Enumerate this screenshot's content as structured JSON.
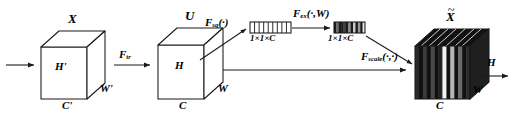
{
  "diagram": {
    "background": "#ffffff",
    "stroke": "#1a1a1a"
  },
  "blocks": {
    "input_cube": {
      "name": "X",
      "top_label": "X",
      "front_label": "H'",
      "right_label": "W'",
      "bottom_label": "C'"
    },
    "feature_cube": {
      "name": "U",
      "top_label": "U",
      "front_label": "H",
      "right_label": "W",
      "bottom_label": "C"
    },
    "output_cube": {
      "name": "X tilde",
      "top_label": "X",
      "top_label_accent": "~",
      "right_label": "H",
      "bottom_right_label": "W",
      "bottom_label": "C"
    }
  },
  "vectors": {
    "squeeze": {
      "label": "1×1×C",
      "segments": 9,
      "fill": "#ffffff"
    },
    "excite": {
      "label": "1×1×C",
      "segments": 13,
      "pattern": [
        "#1a1a1a",
        "#6e6e6e",
        "#1a1a1a",
        "#1a1a1a",
        "#404040",
        "#1a1a1a",
        "#8c8c8c",
        "#1a1a1a",
        "#c9c9c9",
        "#1a1a1a",
        "#9a9a9a",
        "#1a1a1a",
        "#e8e8e8"
      ]
    }
  },
  "operators": {
    "transform": {
      "base": "F",
      "subscript": "tr",
      "args": ""
    },
    "squeeze": {
      "base": "F",
      "subscript": "sq",
      "args": "(·)"
    },
    "excite": {
      "base": "F",
      "subscript": "ex",
      "args": "(·,W)"
    },
    "scale": {
      "base": "F",
      "subscript": "scale",
      "args": "(·,·)"
    }
  },
  "output_stripes": [
    "#2b2b2b",
    "#111111",
    "#3a3a3a",
    "#111111",
    "#4a4a4a",
    "#111111",
    "#222222",
    "#f2f2f2",
    "#111111",
    "#b5b5b5",
    "#111111",
    "#6a6a6a",
    "#111111",
    "#2b2b2b"
  ]
}
